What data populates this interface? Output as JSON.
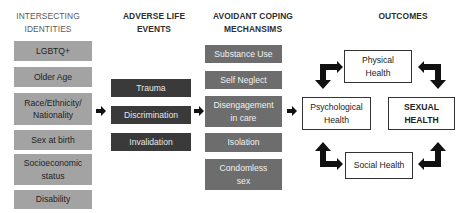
{
  "columns": [
    {
      "id": "identities",
      "header": "INTERSECTING IDENTITIES",
      "items": [
        "LGBTQ+",
        "Older Age",
        "Race/Ethnicity/ Nationality",
        "Sex at birth",
        "Socioeconomic status",
        "Disability"
      ]
    },
    {
      "id": "events",
      "header": "ADVERSE LIFE EVENTS",
      "items": [
        "Trauma",
        "Discrimination",
        "Invalidation"
      ]
    },
    {
      "id": "coping",
      "header": "AVOIDANT COPING MECHANSIMS",
      "items": [
        "Substance Use",
        "Self Neglect",
        "Disengagement in care",
        "Isolation",
        "Condomless sex"
      ]
    },
    {
      "id": "outcomes",
      "header": "OUTCOMES",
      "items": [
        "Physical Health",
        "Psychological Health",
        "SEXUAL HEALTH",
        "Social Health"
      ]
    }
  ],
  "colors": {
    "identity_box": "#a3a3a3",
    "event_box": "#3a3a3a",
    "coping_box": "#6d6d6d",
    "outcome_border": "#333333"
  }
}
